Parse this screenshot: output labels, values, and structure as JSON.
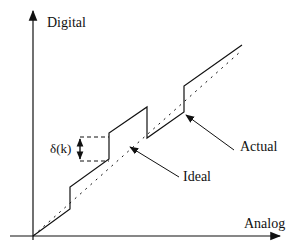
{
  "diagram": {
    "type": "quantization-staircase",
    "axes": {
      "y_label": "Digital",
      "x_label": "Analog"
    },
    "curves": [
      {
        "name": "Actual",
        "style": "solid",
        "description": "non-uniform staircase transfer characteristic"
      },
      {
        "name": "Ideal",
        "style": "dotted",
        "description": "straight diagonal reference line"
      }
    ],
    "annotations": {
      "delta_label": "δ(k)",
      "actual_label": "Actual",
      "ideal_label": "Ideal"
    },
    "colors": {
      "line": "#111111",
      "background": "#ffffff"
    }
  }
}
